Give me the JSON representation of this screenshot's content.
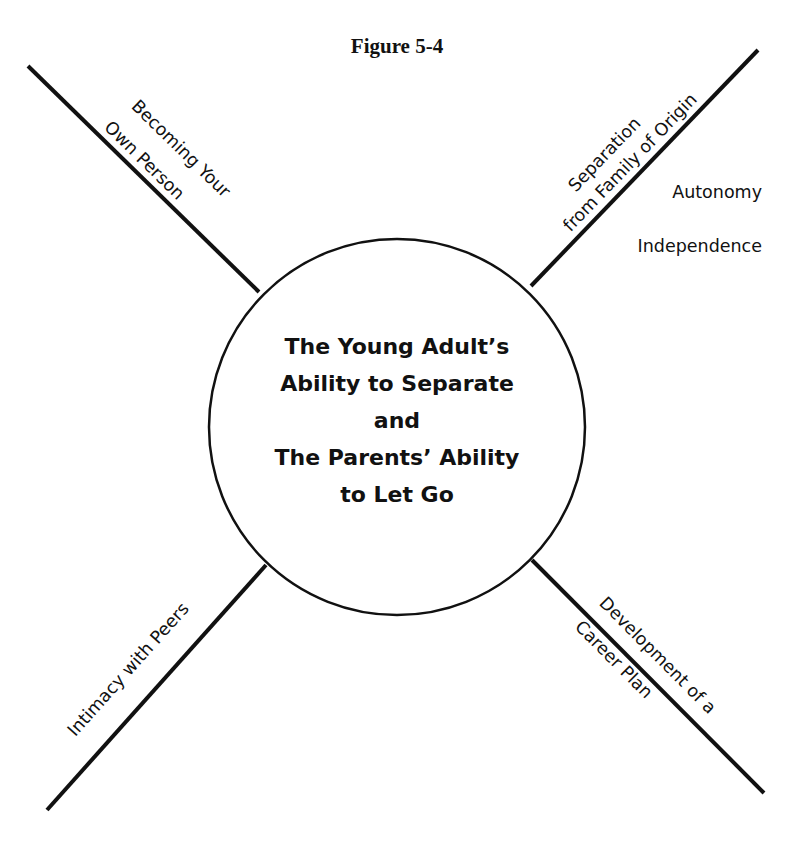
{
  "figure": {
    "title": "Figure 5-4"
  },
  "center": {
    "lines": [
      "The Young Adult’s",
      "Ability to Separate",
      "and",
      "The Parents’ Ability",
      "to Let Go"
    ]
  },
  "arms": {
    "top_left": {
      "line1": "Becoming Your",
      "line2": "Own Person"
    },
    "top_right": {
      "line1": "Separation",
      "line2": "from Family of Origin"
    },
    "top_right_notes": [
      "Autonomy",
      "Independence"
    ],
    "bottom_left": {
      "line1": "Intimacy with Peers"
    },
    "bottom_right": {
      "line1": "Development of a",
      "line2": "Career Plan"
    }
  },
  "colors": {
    "ink": "#111111",
    "background": "#ffffff"
  }
}
